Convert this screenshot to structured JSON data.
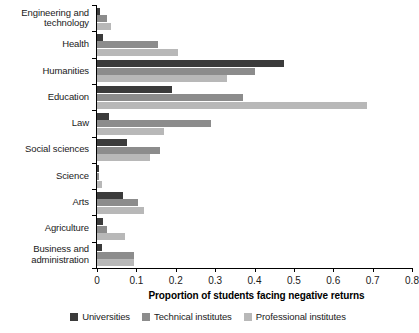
{
  "chart_data": {
    "type": "bar",
    "orientation": "horizontal",
    "title": "",
    "xlabel": "Proportion of students facing negative returns",
    "ylabel": "",
    "xlim": [
      0,
      0.8
    ],
    "xticks": [
      "0",
      "0.1",
      "0.2",
      "0.3",
      "0.4",
      "0.5",
      "0.6",
      "0.7",
      "0.8"
    ],
    "xtick_values": [
      0,
      0.1,
      0.2,
      0.3,
      0.4,
      0.5,
      0.6,
      0.7,
      0.8
    ],
    "grid": false,
    "legend_position": "bottom",
    "categories": [
      "Engineering and technology",
      "Health",
      "Humanities",
      "Education",
      "Law",
      "Social sciences",
      "Science",
      "Arts",
      "Agriculture",
      "Business and administration"
    ],
    "category_labels_wrapped": [
      [
        "Engineering and",
        "technology"
      ],
      [
        "Health"
      ],
      [
        "Humanities"
      ],
      [
        "Education"
      ],
      [
        "Law"
      ],
      [
        "Social sciences"
      ],
      [
        "Science"
      ],
      [
        "Arts"
      ],
      [
        "Agriculture"
      ],
      [
        "Business and",
        "administration"
      ]
    ],
    "series": [
      {
        "name": "Universities",
        "color": "#3b3b3b",
        "values": [
          0.008,
          0.015,
          0.475,
          0.19,
          0.03,
          0.075,
          0.006,
          0.065,
          0.015,
          0.012
        ]
      },
      {
        "name": "Technical institutes",
        "color": "#8c8c8c",
        "values": [
          0.025,
          0.155,
          0.4,
          0.37,
          0.29,
          0.16,
          0.004,
          0.105,
          0.025,
          0.095
        ]
      },
      {
        "name": "Professional institutes",
        "color": "#b8b8b8",
        "values": [
          0.035,
          0.205,
          0.33,
          0.685,
          0.17,
          0.135,
          0.012,
          0.12,
          0.07,
          0.095
        ]
      }
    ]
  },
  "legend": {
    "items": [
      {
        "label": "Universities",
        "color": "#3b3b3b"
      },
      {
        "label": "Technical institutes",
        "color": "#8c8c8c"
      },
      {
        "label": "Professional institutes",
        "color": "#b8b8b8"
      }
    ]
  },
  "axis": {
    "x_title": "Proportion of students facing negative returns"
  }
}
